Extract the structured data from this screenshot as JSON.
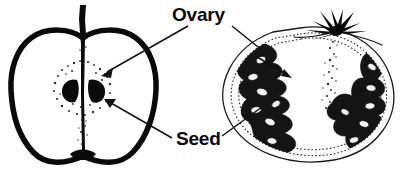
{
  "figure": {
    "background_color": "#fefefe",
    "ink_color": "#0a0a0a",
    "width": 405,
    "height": 171
  },
  "labels": [
    {
      "id": "ovary",
      "text": "Ovary",
      "x": 172,
      "y": 20,
      "points_to": [
        "apple-ovary-core",
        "tomato-ovary-locule"
      ]
    },
    {
      "id": "seed",
      "text": "Seed",
      "x": 176,
      "y": 144,
      "points_to": [
        "apple-seed",
        "tomato-seed"
      ]
    }
  ],
  "specimens": [
    {
      "id": "apple",
      "name": "apple-cross-section",
      "outline_style": "thick-black",
      "parts": [
        {
          "name": "apple-stem",
          "type": "stem"
        },
        {
          "name": "apple-flesh",
          "type": "flesh"
        },
        {
          "name": "apple-core",
          "type": "ovary"
        },
        {
          "name": "apple-seed-left",
          "type": "seed"
        },
        {
          "name": "apple-seed-right",
          "type": "seed"
        },
        {
          "name": "apple-calyx",
          "type": "calyx"
        }
      ]
    },
    {
      "id": "tomato",
      "name": "tomato-cross-section",
      "outline_style": "thin-black",
      "parts": [
        {
          "name": "tomato-calyx",
          "type": "calyx"
        },
        {
          "name": "tomato-skin",
          "type": "skin"
        },
        {
          "name": "tomato-pericarp",
          "type": "flesh"
        },
        {
          "name": "tomato-locule-left",
          "type": "ovary"
        },
        {
          "name": "tomato-locule-right",
          "type": "ovary"
        },
        {
          "name": "tomato-columella",
          "type": "placenta"
        },
        {
          "name": "tomato-seeds",
          "type": "seed"
        }
      ]
    }
  ],
  "leaders": [
    {
      "name": "ovary-leader-apple",
      "from": [
        188,
        26
      ],
      "to": [
        103,
        75
      ],
      "arrow": true
    },
    {
      "name": "ovary-leader-tomato",
      "from": [
        232,
        26
      ],
      "to": [
        264,
        50
      ],
      "arrow": false
    },
    {
      "name": "ovary-arrow-tomato",
      "from": [
        255,
        57
      ],
      "to": [
        288,
        76
      ],
      "arrow": true
    },
    {
      "name": "seed-leader-apple",
      "from": [
        172,
        138
      ],
      "to": [
        105,
        104
      ],
      "arrow": true
    },
    {
      "name": "seed-leader-tomato",
      "from": [
        222,
        136
      ],
      "to": [
        259,
        108
      ],
      "arrow": false
    }
  ]
}
